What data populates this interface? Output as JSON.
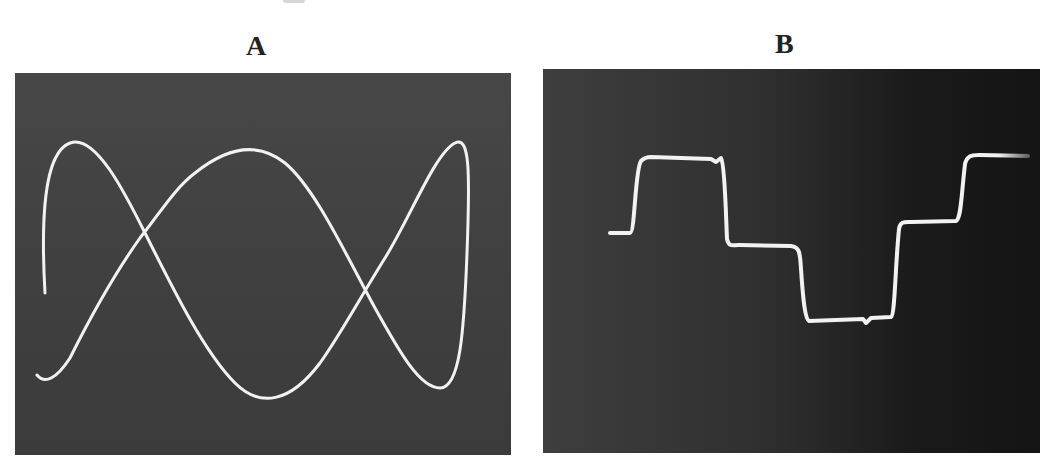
{
  "figure": {
    "panels": [
      {
        "label": "A",
        "description": "Oscilloscope photograph of a Lissajous figure (frequency ratio ~ 1:3) with two crossing points",
        "background": "#444444",
        "trace_color": "#f2f2f2",
        "trace_path": "M 30 220 C 26 150, 28 80, 55 70 C 80 60, 110 120, 130 160 C 160 220, 190 280, 220 310 C 245 335, 275 330, 305 290 C 325 262, 345 225, 370 185 C 395 145, 420 80, 440 70 C 455 62, 455 100, 452 180 C 449 260, 445 315, 425 315 C 405 315, 385 280, 360 235 C 330 180, 300 115, 270 90 C 245 70, 215 72, 180 100 C 160 115, 145 140, 125 165 C 100 200, 75 245, 55 285 C 42 305, 30 312, 22 302"
      },
      {
        "label": "B",
        "description": "Oscilloscope photograph of a stepped (staircase) waveform",
        "background": "#2a2a2a",
        "trace_color": "#f2f2f2",
        "trace_path": "M 67 164 L 87 164 C 92 164, 92 100, 98 92 C 100 90, 102 88, 108 88 L 168 90 L 173 93 L 178 89 C 182 95, 183 150, 184 170 C 186 178, 188 176, 196 176 L 248 177 C 256 178, 257 182, 258 200 C 260 230, 262 250, 266 252 L 320 250 L 323 254 L 328 249 L 348 248 C 352 246, 352 200, 356 160 C 357 152, 362 153, 368 153 L 413 152 C 418 150, 418 130, 422 95 C 424 87, 428 86, 436 86 L 485 87"
      }
    ]
  }
}
